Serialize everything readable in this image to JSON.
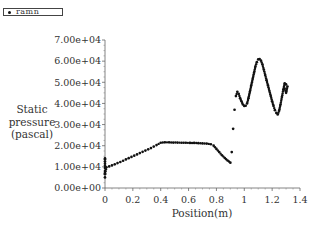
{
  "legend": {
    "label": "ramn"
  },
  "chart_data": {
    "type": "scatter",
    "title": "",
    "xlabel": "Position(m)",
    "ylabel": [
      "Static",
      "pressure",
      "(pascal)"
    ],
    "xlim": [
      0,
      1.4
    ],
    "ylim": [
      0,
      70000
    ],
    "xticks": [
      0,
      0.2,
      0.4,
      0.6,
      0.8,
      1,
      1.2,
      1.4
    ],
    "xtick_labels": [
      "0",
      "0.2",
      "0.4",
      "0.6",
      "0.8",
      "1",
      "1.2",
      "1.4"
    ],
    "yticks": [
      0,
      10000,
      20000,
      30000,
      40000,
      50000,
      60000,
      70000
    ],
    "ytick_labels": [
      "0.00e+00",
      "1.00e+04",
      "2.00e+04",
      "3.00e+04",
      "4.00e+04",
      "5.00e+04",
      "6.00e+04",
      "7.00e+04"
    ],
    "grid": false,
    "legend_position": "top-left",
    "marker_color": "#111111",
    "series": [
      {
        "name": "ramn",
        "x": [
          0,
          0,
          0,
          0,
          0,
          0,
          0,
          0,
          0,
          0,
          0.01,
          0.03,
          0.05,
          0.07,
          0.09,
          0.11,
          0.13,
          0.15,
          0.17,
          0.19,
          0.21,
          0.23,
          0.25,
          0.27,
          0.29,
          0.31,
          0.33,
          0.35,
          0.37,
          0.4,
          0.43,
          0.46,
          0.49,
          0.52,
          0.55,
          0.58,
          0.61,
          0.64,
          0.67,
          0.7,
          0.73,
          0.76,
          0.78,
          0.8,
          0.82,
          0.84,
          0.86,
          0.88,
          0.9,
          0.91,
          0.92,
          0.93,
          0.94,
          0.95,
          0.96,
          0.97,
          0.98,
          0.99,
          1.0,
          1.01,
          1.02,
          1.03,
          1.04,
          1.05,
          1.06,
          1.07,
          1.08,
          1.09,
          1.1,
          1.11,
          1.12,
          1.13,
          1.14,
          1.15,
          1.16,
          1.17,
          1.18,
          1.19,
          1.2,
          1.21,
          1.22,
          1.23,
          1.24,
          1.25,
          1.26,
          1.27,
          1.28,
          1.29,
          1.3,
          1.31,
          1.3,
          1.29
        ],
        "y": [
          5000,
          6500,
          8000,
          9500,
          10500,
          11500,
          12500,
          13500,
          14000,
          7000,
          9800,
          10200,
          10700,
          11200,
          11800,
          12300,
          12900,
          13500,
          14100,
          14700,
          15300,
          15900,
          16500,
          17100,
          17700,
          18300,
          18900,
          19600,
          20300,
          21400,
          21600,
          21600,
          21500,
          21500,
          21400,
          21400,
          21300,
          21300,
          21200,
          21100,
          21000,
          20700,
          20000,
          18500,
          17000,
          15500,
          14200,
          13000,
          12000,
          17000,
          28000,
          37000,
          43500,
          45500,
          44500,
          42500,
          41000,
          39500,
          38800,
          38900,
          40000,
          42500,
          45500,
          48500,
          51500,
          54500,
          57500,
          59500,
          60800,
          61000,
          60200,
          58500,
          56000,
          53500,
          51000,
          48500,
          46000,
          43500,
          41000,
          38800,
          36800,
          35500,
          34800,
          36500,
          39500,
          43000,
          46500,
          49500,
          49000,
          48000,
          45000,
          47000
        ]
      }
    ]
  }
}
